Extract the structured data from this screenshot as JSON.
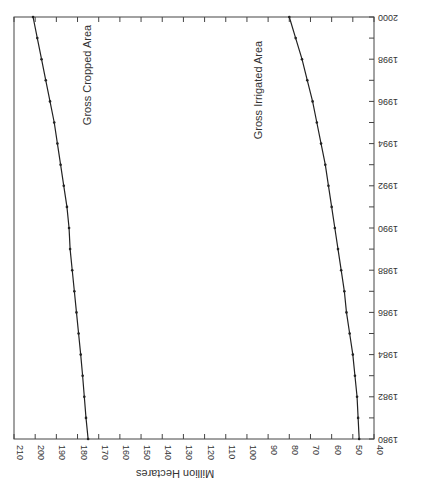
{
  "chart_data": {
    "type": "line",
    "orientation": "rotated 90 degrees clockwise (years run bottom-to-top on right edge, values run right-to-left along bottom)",
    "title": "",
    "xlabel": "",
    "ylabel": "Million Hectares",
    "x": [
      1980,
      1981,
      1982,
      1983,
      1984,
      1985,
      1986,
      1987,
      1988,
      1989,
      1990,
      1991,
      1992,
      1993,
      1994,
      1995,
      1996,
      1997,
      1998,
      1999,
      2000
    ],
    "x_tick_labels": [
      "1980",
      "1982",
      "1984",
      "1986",
      "1988",
      "1990",
      "1992",
      "1994",
      "1996",
      "1998",
      "2000"
    ],
    "y_tick_labels": [
      "40",
      "50",
      "60",
      "70",
      "80",
      "90",
      "100",
      "110",
      "120",
      "130",
      "140",
      "150",
      "160",
      "170",
      "180",
      "190",
      "200",
      "210"
    ],
    "xlim": [
      1980,
      2000
    ],
    "ylim": [
      40,
      210
    ],
    "grid": false,
    "legend": "none (inline line labels)",
    "series": [
      {
        "name": "Gross Cropped Area",
        "values": [
          175,
          176,
          176.8,
          177.6,
          178.5,
          179.5,
          180.5,
          181.5,
          182.5,
          183.5,
          184,
          185,
          186.5,
          188,
          189.5,
          191,
          193,
          195,
          197,
          199,
          201
        ]
      },
      {
        "name": "Gross Irrigated Area",
        "values": [
          47,
          47.5,
          48,
          49,
          50,
          51.5,
          53,
          54,
          55.5,
          57,
          58.5,
          60,
          61.5,
          63,
          65,
          67,
          69,
          71.5,
          74,
          77,
          80
        ]
      }
    ]
  },
  "labels": {
    "ylabel": "Million Hectares",
    "series_0": "Gross Cropped Area",
    "series_1": "Gross Irrigated Area"
  },
  "colors": {
    "line": "#222222",
    "axis": "#444444",
    "background": "#ffffff"
  }
}
